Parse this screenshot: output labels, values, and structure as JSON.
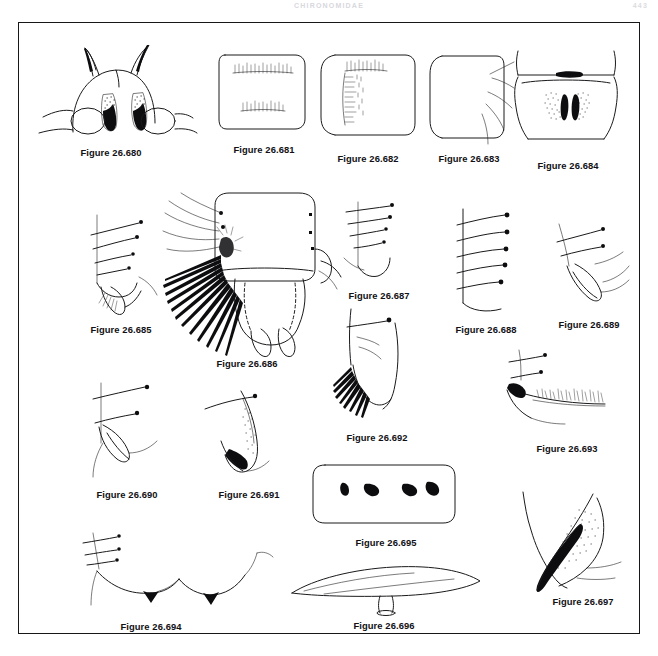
{
  "page": {
    "header_title": "CHIRONOMIDAE",
    "folio": "443",
    "plate_label": "figure-plate"
  },
  "plate": {
    "caption_prefix": "Figure",
    "figures": [
      {
        "id": "26.680",
        "caption": "Figure 26.680",
        "subject": "insect-head-with-dark-patches"
      },
      {
        "id": "26.681",
        "caption": "Figure 26.681",
        "subject": "sclerite-with-bristle-row"
      },
      {
        "id": "26.682",
        "caption": "Figure 26.682",
        "subject": "sclerite-with-vertical-bristle-band"
      },
      {
        "id": "26.683",
        "caption": "Figure 26.683",
        "subject": "rounded-sclerite-with-setae"
      },
      {
        "id": "26.684",
        "caption": "Figure 26.684",
        "subject": "segment-with-stippled-spot-pair"
      },
      {
        "id": "26.685",
        "caption": "Figure 26.685",
        "subject": "claw-with-setae"
      },
      {
        "id": "26.686",
        "caption": "Figure 26.686",
        "subject": "abdominal-segments-with-hair-fringe"
      },
      {
        "id": "26.687",
        "caption": "Figure 26.687",
        "subject": "seta-bearing-structure"
      },
      {
        "id": "26.688",
        "caption": "Figure 26.688",
        "subject": "comb-with-four-spines"
      },
      {
        "id": "26.689",
        "caption": "Figure 26.689",
        "subject": "curved-claw-with-seta"
      },
      {
        "id": "26.690",
        "caption": "Figure 26.690",
        "subject": "claw-with-two-setae"
      },
      {
        "id": "26.691",
        "caption": "Figure 26.691",
        "subject": "stippled-claw-with-seta"
      },
      {
        "id": "26.692",
        "caption": "Figure 26.692",
        "subject": "lobe-with-hair-comb"
      },
      {
        "id": "26.693",
        "caption": "Figure 26.693",
        "subject": "bristle-row-on-margin"
      },
      {
        "id": "26.694",
        "caption": "Figure 26.694",
        "subject": "wide-arch-with-dark-teeth"
      },
      {
        "id": "26.695",
        "caption": "Figure 26.695",
        "subject": "plate-with-four-dark-hooks"
      },
      {
        "id": "26.696",
        "caption": "Figure 26.696",
        "subject": "elongate-blade-with-stem"
      },
      {
        "id": "26.697",
        "caption": "Figure 26.697",
        "subject": "stippled-pointed-lobe"
      }
    ]
  }
}
